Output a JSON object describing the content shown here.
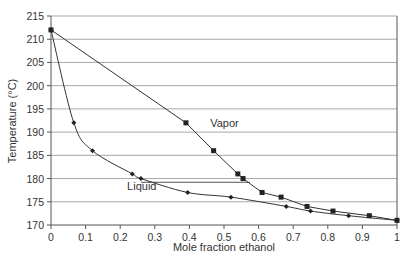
{
  "chart_data": {
    "type": "line",
    "title": "",
    "xlabel": "Mole fraction ethanol",
    "ylabel": "Temperature (°C)",
    "xlim": [
      0,
      1
    ],
    "ylim": [
      170,
      215
    ],
    "xticks": [
      0,
      0.1,
      0.2,
      0.3,
      0.4,
      0.5,
      0.6,
      0.7,
      0.8,
      0.9,
      1
    ],
    "xtick_labels": [
      "0",
      "0.1",
      "0.2",
      "0.3",
      "0.4",
      "0.5",
      "0.6",
      "0.7",
      "0.8",
      "0.9",
      "1"
    ],
    "yticks": [
      170,
      175,
      180,
      185,
      190,
      195,
      200,
      205,
      210,
      215
    ],
    "ytick_labels": [
      "170",
      "175",
      "180",
      "185",
      "190",
      "195",
      "200",
      "205",
      "210",
      "215"
    ],
    "grid": "horizontal",
    "legend": "none",
    "series": [
      {
        "name": "Vapor",
        "marker": "square",
        "x": [
          0,
          0.39,
          0.47,
          0.54,
          0.555,
          0.61,
          0.665,
          0.74,
          0.815,
          0.92,
          1
        ],
        "y": [
          212,
          192,
          186,
          181,
          180,
          177,
          176,
          174,
          173,
          172,
          171
        ]
      },
      {
        "name": "Liquid",
        "marker": "diamond",
        "x": [
          0,
          0.066,
          0.12,
          0.235,
          0.26,
          0.395,
          0.52,
          0.68,
          0.75,
          0.86,
          1
        ],
        "y": [
          212,
          192,
          186,
          181,
          180,
          177,
          176,
          174,
          173,
          172,
          171
        ]
      }
    ],
    "tie_line": {
      "x": [
        0.26,
        0.575
      ],
      "y": 179.2
    },
    "annotations": [
      {
        "text": "Vapor",
        "x": 0.46,
        "y": 192
      },
      {
        "text": "Liquid",
        "x": 0.22,
        "y": 178.5
      }
    ]
  }
}
